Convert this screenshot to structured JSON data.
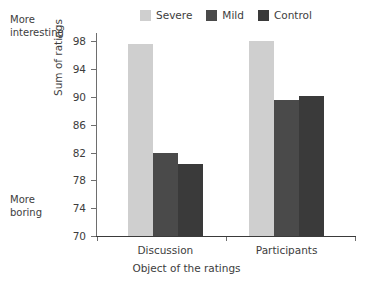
{
  "chart_data": {
    "type": "bar",
    "title": "",
    "subtitle": "",
    "xlabel": "Object of the ratings",
    "ylabel": "Sum of ratings",
    "categories": [
      "Discussion",
      "Participants"
    ],
    "series": [
      {
        "name": "Severe",
        "color": "#cfcfcf",
        "values": [
          97.6,
          98.1
        ]
      },
      {
        "name": "Mild",
        "color": "#4a4a4a",
        "values": [
          82.0,
          89.6
        ]
      },
      {
        "name": "Control",
        "color": "#3a3a3a",
        "values": [
          80.3,
          90.1
        ]
      }
    ],
    "ylim": [
      70,
      99.2
    ],
    "yticks": [
      70,
      74,
      78,
      82,
      86,
      90,
      94,
      98
    ],
    "ytick_labels": [
      "70",
      "74",
      "78",
      "82",
      "86",
      "90",
      "94",
      "98"
    ],
    "grid": false,
    "legend_position": "top-center",
    "annotations": [
      {
        "name": "more-interesting",
        "line1": "More",
        "line2": "interesting",
        "position": "top-left-outside"
      },
      {
        "name": "more-boring",
        "line1": "More",
        "line2": "boring",
        "position": "bottom-left-outside"
      }
    ]
  },
  "legend": {
    "items": [
      {
        "label": "Severe",
        "swatch_color": "#cfcfcf"
      },
      {
        "label": "Mild",
        "swatch_color": "#4a4a4a"
      },
      {
        "label": "Control",
        "swatch_color": "#3a3a3a"
      }
    ]
  },
  "notes": {
    "top": {
      "line1": "More",
      "line2": "interesting"
    },
    "bottom": {
      "line1": "More",
      "line2": "boring"
    }
  },
  "axes": {
    "y_title": "Sum of ratings",
    "x_title": "Object of the ratings",
    "y_tick_labels": [
      "98",
      "94",
      "90",
      "86",
      "82",
      "78",
      "74",
      "70"
    ],
    "x_group_labels": [
      "Discussion",
      "Participants"
    ]
  }
}
